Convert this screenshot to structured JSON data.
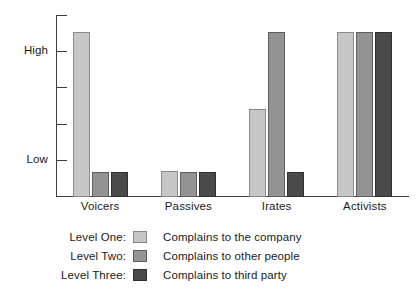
{
  "chart_data": {
    "type": "bar",
    "title": "",
    "subtitle": "",
    "xlabel": "",
    "ylabel": "",
    "grid": false,
    "legend_position": "bottom",
    "categories": [
      "Voicers",
      "Passives",
      "Irates",
      "Activists"
    ],
    "ytick_labels": [
      "High",
      "Low"
    ],
    "ytick_count": 5,
    "ylim": [
      0,
      5
    ],
    "value_scale_note": "Qualitative axis: 0 = baseline, Low tick = 1, High tick = 4",
    "series": [
      {
        "name": "Level One",
        "legend_label": "Level One:",
        "description": "Complains to the company",
        "color": "#c6c6c6",
        "values": [
          4.55,
          0.72,
          2.42,
          4.55
        ]
      },
      {
        "name": "Level Two",
        "legend_label": "Level Two:",
        "description": "Complains to other people",
        "color": "#939393",
        "values": [
          0.68,
          0.68,
          4.55,
          4.55
        ]
      },
      {
        "name": "Level Three",
        "legend_label": "Level Three:",
        "description": "Complains to third party",
        "color": "#4a4a4a",
        "values": [
          0.68,
          0.68,
          0.68,
          4.55
        ]
      }
    ]
  },
  "axis": {
    "ticks": [
      {
        "label": "",
        "pos": 0
      },
      {
        "label": "High",
        "pos": 1
      },
      {
        "label": "",
        "pos": 2
      },
      {
        "label": "",
        "pos": 3
      },
      {
        "label": "Low",
        "pos": 4
      }
    ]
  },
  "legend": {
    "rows": [
      {
        "label": "Level One:",
        "text": "Complains to the company",
        "color": "#c6c6c6"
      },
      {
        "label": "Level Two:",
        "text": "Complains to other people",
        "color": "#939393"
      },
      {
        "label": "Level Three:",
        "text": "Complains to third party",
        "color": "#4a4a4a"
      }
    ]
  }
}
